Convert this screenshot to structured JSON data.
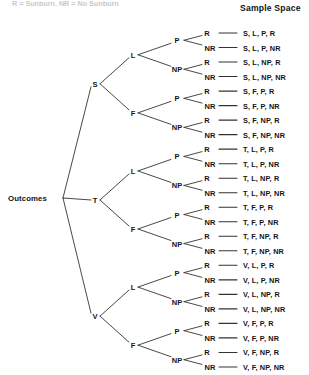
{
  "caption": {
    "top_cut_text": "R = Sunburn, NR = No Sunburn"
  },
  "header": {
    "sample_space_label": "Sample Space"
  },
  "tree": {
    "root_label": "Outcomes",
    "level1": [
      {
        "label": "S"
      },
      {
        "label": "T"
      },
      {
        "label": "V"
      }
    ],
    "level2": [
      {
        "label": "L"
      },
      {
        "label": "F"
      }
    ],
    "level3": [
      {
        "label": "P"
      },
      {
        "label": "NP"
      }
    ],
    "level4": [
      {
        "label": "R"
      },
      {
        "label": "NR"
      }
    ]
  },
  "leaves": [
    {
      "branch": "R",
      "outcome": "S, L, P, R"
    },
    {
      "branch": "NR",
      "outcome": "S, L, P, NR"
    },
    {
      "branch": "R",
      "outcome": "S, L, NP, R"
    },
    {
      "branch": "NR",
      "outcome": "S, L, NP, NR"
    },
    {
      "branch": "R",
      "outcome": "S, F, P, R"
    },
    {
      "branch": "NR",
      "outcome": "S, F, P, NR"
    },
    {
      "branch": "R",
      "outcome": "S, F, NP, R"
    },
    {
      "branch": "NR",
      "outcome": "S, F, NP, NR"
    },
    {
      "branch": "R",
      "outcome": "T, L, P, R"
    },
    {
      "branch": "NR",
      "outcome": "T, L, P, NR"
    },
    {
      "branch": "R",
      "outcome": "T, L, NP, R"
    },
    {
      "branch": "NR",
      "outcome": "T, L, NP, NR"
    },
    {
      "branch": "R",
      "outcome": "T, F, P, R"
    },
    {
      "branch": "NR",
      "outcome": "T, F, P, NR"
    },
    {
      "branch": "R",
      "outcome": "T, F, NP, R"
    },
    {
      "branch": "NR",
      "outcome": "T, F, NP, NR"
    },
    {
      "branch": "R",
      "outcome": "V, L, P, R"
    },
    {
      "branch": "NR",
      "outcome": "V, L, P, NR"
    },
    {
      "branch": "R",
      "outcome": "V, L, NP, R"
    },
    {
      "branch": "NR",
      "outcome": "V, L, NP, NR"
    },
    {
      "branch": "R",
      "outcome": "V, F, P, R"
    },
    {
      "branch": "NR",
      "outcome": "V, F, P, NR"
    },
    {
      "branch": "R",
      "outcome": "V, F, NP, R"
    },
    {
      "branch": "NR",
      "outcome": "V, F, NP, NR"
    }
  ],
  "groups": {
    "level1_labels": [
      "S",
      "T",
      "V"
    ],
    "level2_labels": [
      "L",
      "F"
    ],
    "level3_labels": [
      "P",
      "NP"
    ]
  },
  "style": {
    "line_color": "#333333",
    "text_color": "#141414"
  }
}
